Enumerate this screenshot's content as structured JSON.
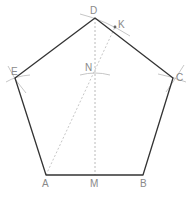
{
  "diagram": {
    "colors": {
      "edge": "#333333",
      "construction": "#b0b0b0",
      "label": "#8a8a8a",
      "point": "#666666"
    },
    "points": {
      "A": {
        "label": "A",
        "x": 46,
        "y": 175
      },
      "B": {
        "label": "B",
        "x": 143,
        "y": 175
      },
      "C": {
        "label": "C",
        "x": 173,
        "y": 78
      },
      "D": {
        "label": "D",
        "x": 95,
        "y": 18
      },
      "E": {
        "label": "E",
        "x": 15,
        "y": 78
      },
      "M": {
        "label": "M",
        "x": 95,
        "y": 175
      },
      "N": {
        "label": "N",
        "x": 95,
        "y": 73
      },
      "K": {
        "label": "K",
        "x": 115,
        "y": 27
      }
    },
    "pentagon": [
      "A",
      "B",
      "C",
      "D",
      "E"
    ],
    "construction_lines": [
      {
        "from": "D",
        "to": "M",
        "style": "dashed"
      },
      {
        "from": "A",
        "to": "K",
        "style": "dashed"
      }
    ],
    "arcs": [
      "E",
      "C",
      "N",
      "K-D"
    ]
  }
}
